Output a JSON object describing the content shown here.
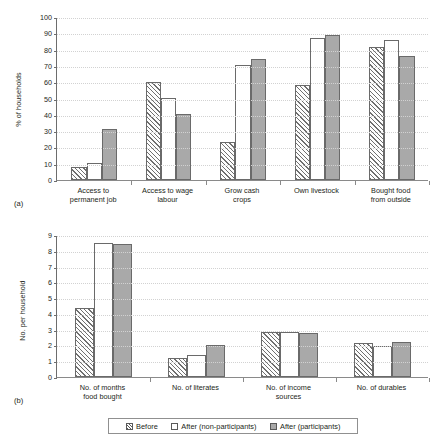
{
  "figure": {
    "panel_a_tag": "(a)",
    "panel_b_tag": "(b)"
  },
  "legend": {
    "items": [
      {
        "key": "before",
        "label": "Before",
        "style": "hatched",
        "color": "#ffffff"
      },
      {
        "key": "after-non",
        "label": "After (non-participants)",
        "style": "open",
        "color": "#ffffff"
      },
      {
        "key": "after-part",
        "label": "After (participants)",
        "style": "filled",
        "color": "#a9a9a9"
      }
    ]
  },
  "chart_data": [
    {
      "type": "bar",
      "panel": "(a)",
      "title": "",
      "xlabel": "",
      "ylabel": "% of households",
      "ylim": [
        0,
        100
      ],
      "ytick_step": 10,
      "yticks": [
        "0",
        "10",
        "20",
        "30",
        "40",
        "50",
        "60",
        "70",
        "80",
        "90",
        "100"
      ],
      "grid": true,
      "legend_position": "bottom",
      "categories": [
        "Access to\npermanent job",
        "Access to wage\nlabour",
        "Grow cash\ncrops",
        "Own livestock",
        "Bought food\nfrom outside"
      ],
      "series": [
        {
          "name": "Before",
          "values": [
            8,
            60,
            23.5,
            58.5,
            81.5
          ]
        },
        {
          "name": "After (non-participants)",
          "values": [
            10.5,
            50.5,
            70.5,
            87,
            86
          ]
        },
        {
          "name": "After (participants)",
          "values": [
            31,
            40.5,
            74.5,
            89,
            76
          ]
        }
      ]
    },
    {
      "type": "bar",
      "panel": "(b)",
      "title": "",
      "xlabel": "",
      "ylabel": "No. per household",
      "ylim": [
        0,
        9
      ],
      "ytick_step": 1,
      "yticks": [
        "0",
        "1",
        "2",
        "3",
        "4",
        "5",
        "6",
        "7",
        "8",
        "9"
      ],
      "grid": true,
      "legend_position": "bottom",
      "categories": [
        "No. of months\nfood bought",
        "No. of literates",
        "No. of income\nsources",
        "No. of durables"
      ],
      "series": [
        {
          "name": "Before",
          "values": [
            4.4,
            1.2,
            2.87,
            2.17
          ]
        },
        {
          "name": "After (non-participants)",
          "values": [
            8.5,
            1.4,
            2.87,
            1.95
          ]
        },
        {
          "name": "After (participants)",
          "values": [
            8.45,
            2.0,
            2.82,
            2.2
          ]
        }
      ]
    }
  ]
}
